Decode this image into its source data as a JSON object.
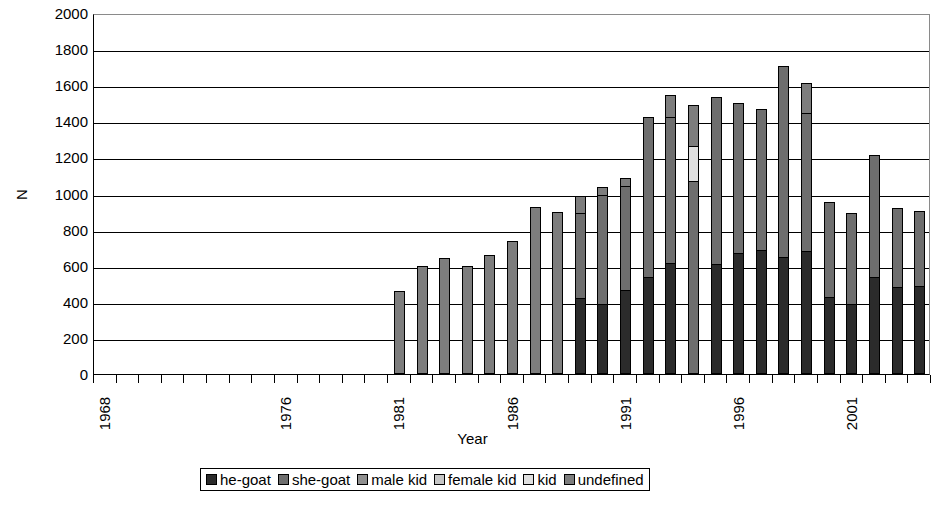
{
  "chart_data": {
    "type": "bar",
    "subtype": "stacked-bar",
    "title": "",
    "xlabel": "Year",
    "ylabel": "N",
    "ylim": [
      0,
      2000
    ],
    "ytick_step": 200,
    "yticks": [
      0,
      200,
      400,
      600,
      800,
      1000,
      1200,
      1400,
      1600,
      1800,
      2000
    ],
    "grid": "horizontal",
    "legend_position": "bottom",
    "xlim": [
      1968,
      2004
    ],
    "categories": [
      1968,
      1969,
      1970,
      1971,
      1972,
      1973,
      1974,
      1975,
      1976,
      1977,
      1978,
      1979,
      1980,
      1981,
      1982,
      1983,
      1984,
      1985,
      1986,
      1987,
      1988,
      1989,
      1990,
      1991,
      1992,
      1993,
      1994,
      1995,
      1996,
      1997,
      1998,
      1999,
      2000,
      2001,
      2002,
      2003,
      2004
    ],
    "xtick_labels": [
      {
        "year": 1968,
        "label": "1968"
      },
      {
        "year": 1976,
        "label": "1976"
      },
      {
        "year": 1981,
        "label": "1981"
      },
      {
        "year": 1986,
        "label": "1986"
      },
      {
        "year": 1991,
        "label": "1991"
      },
      {
        "year": 1996,
        "label": "1996"
      },
      {
        "year": 2001,
        "label": "2001"
      }
    ],
    "series": [
      {
        "name": "he-goat",
        "color": "#2b2b2b",
        "values": [
          0,
          0,
          0,
          0,
          0,
          0,
          0,
          0,
          0,
          0,
          0,
          0,
          0,
          0,
          0,
          0,
          0,
          0,
          0,
          0,
          0,
          420,
          390,
          465,
          540,
          615,
          0,
          610,
          670,
          685,
          650,
          680,
          425,
          390,
          535,
          480,
          485
        ]
      },
      {
        "name": "she-goat",
        "color": "#6e6e6e",
        "values": [
          0,
          0,
          0,
          0,
          0,
          0,
          0,
          0,
          0,
          0,
          0,
          0,
          0,
          0,
          0,
          0,
          0,
          0,
          0,
          0,
          0,
          480,
          610,
          580,
          890,
          815,
          1070,
          930,
          835,
          790,
          1060,
          770,
          535,
          510,
          685,
          445,
          425
        ]
      },
      {
        "name": "male kid",
        "color": "#8f8f8f",
        "values": [
          0,
          0,
          0,
          0,
          0,
          0,
          0,
          0,
          0,
          0,
          0,
          0,
          0,
          0,
          0,
          0,
          0,
          0,
          0,
          0,
          0,
          0,
          0,
          0,
          0,
          0,
          0,
          0,
          0,
          0,
          0,
          0,
          0,
          0,
          0,
          0,
          0
        ]
      },
      {
        "name": "female kid",
        "color": "#c6c6c6",
        "values": [
          0,
          0,
          0,
          0,
          0,
          0,
          0,
          0,
          0,
          0,
          0,
          0,
          0,
          0,
          0,
          0,
          0,
          0,
          0,
          0,
          0,
          0,
          0,
          0,
          0,
          0,
          0,
          0,
          0,
          0,
          0,
          0,
          0,
          0,
          0,
          0,
          0
        ]
      },
      {
        "name": "kid",
        "color": "#e0e0e0",
        "values": [
          0,
          0,
          0,
          0,
          0,
          0,
          0,
          0,
          0,
          0,
          0,
          0,
          0,
          0,
          0,
          0,
          0,
          0,
          0,
          0,
          0,
          0,
          0,
          0,
          0,
          0,
          200,
          0,
          0,
          0,
          0,
          0,
          0,
          0,
          0,
          0,
          0
        ]
      },
      {
        "name": "undefined",
        "color": "#7d7d7d",
        "values": [
          0,
          0,
          0,
          0,
          0,
          0,
          0,
          0,
          0,
          0,
          0,
          0,
          0,
          460,
          600,
          640,
          600,
          660,
          735,
          925,
          900,
          100,
          50,
          50,
          0,
          125,
          230,
          0,
          0,
          0,
          0,
          175,
          0,
          0,
          0,
          0,
          0
        ]
      }
    ],
    "totals": [
      0,
      0,
      0,
      0,
      0,
      0,
      0,
      0,
      0,
      0,
      0,
      0,
      0,
      460,
      600,
      640,
      600,
      660,
      735,
      925,
      900,
      1000,
      1050,
      1095,
      1430,
      1555,
      1300,
      1540,
      1505,
      1475,
      1710,
      1625,
      960,
      900,
      1220,
      925,
      910
    ]
  },
  "legend": {
    "items": [
      {
        "label": "he-goat",
        "color": "#2b2b2b"
      },
      {
        "label": "she-goat",
        "color": "#6e6e6e"
      },
      {
        "label": "male kid",
        "color": "#8f8f8f"
      },
      {
        "label": "female kid",
        "color": "#c6c6c6"
      },
      {
        "label": "kid",
        "color": "#e0e0e0"
      },
      {
        "label": "undefined",
        "color": "#7d7d7d"
      }
    ]
  }
}
